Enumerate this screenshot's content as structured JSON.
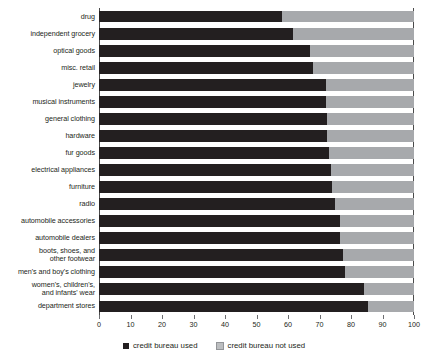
{
  "chart_data": {
    "type": "bar",
    "orientation": "horizontal",
    "stacked": true,
    "title": "",
    "xlabel": "",
    "ylabel": "",
    "xlim": [
      0,
      100
    ],
    "xticks": [
      0,
      10,
      20,
      30,
      40,
      50,
      60,
      70,
      80,
      90,
      100
    ],
    "grid": false,
    "legend_position": "bottom-center",
    "categories": [
      "drug",
      "independent grocery",
      "optical goods",
      "misc. retail",
      "jewelry",
      "musical instruments",
      "general clothing",
      "hardware",
      "fur goods",
      "electrical appliances",
      "furniture",
      "radio",
      "automobile accessories",
      "automobile dealers",
      "boots, shoes, and other footwear",
      "men's and boy's clothing",
      "women's, children's, and infants' wear",
      "department stores"
    ],
    "series": [
      {
        "name": "credit bureau used",
        "color": "#231f20",
        "values": [
          58,
          61.5,
          67,
          68,
          72,
          72,
          72.5,
          72.5,
          73,
          73.5,
          74,
          75,
          76.5,
          76.5,
          77.5,
          78,
          84,
          85.5
        ]
      },
      {
        "name": "credit bureau not used",
        "color": "#a7a9ac",
        "values": [
          42,
          38.5,
          33,
          32,
          28,
          28,
          27.5,
          27.5,
          27,
          26.5,
          26,
          25,
          23.5,
          23.5,
          22.5,
          22,
          16,
          14.5
        ]
      }
    ]
  },
  "legend": {
    "items": [
      {
        "label": "credit bureau used",
        "swatch": "dark-swatch-icon"
      },
      {
        "label": "credit bureau not used",
        "swatch": "light-swatch-icon"
      }
    ]
  }
}
